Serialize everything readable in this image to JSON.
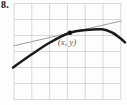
{
  "figure": {
    "problem_number": "8.",
    "point_label": "(x, y)",
    "colors": {
      "background": "#fdfdfd",
      "grid_line": "#c8c8c8",
      "tangent_line": "#a2a2a2",
      "curve": "#1b1b1b",
      "point_dot": "#111111",
      "point_label_text": "#5a5a5a",
      "problem_number_text": "#111111"
    },
    "grid": {
      "x0": 14,
      "y0": 3.5,
      "x1": 120.8,
      "y1": 99.5,
      "cols": 6,
      "rows": 6
    },
    "tangent_line": {
      "x1": 14,
      "y1": 45.7,
      "x2": 121,
      "y2": 21
    },
    "curve_points": [
      [
        13,
        67.5
      ],
      [
        30,
        55.5
      ],
      [
        50,
        42.5
      ],
      [
        70,
        32.8
      ],
      [
        86,
        30
      ],
      [
        102,
        29.3
      ],
      [
        112,
        32.5
      ],
      [
        120,
        38
      ],
      [
        125,
        42.5
      ]
    ],
    "tangency_point": {
      "x": 70,
      "y": 32.8,
      "r": 2.3
    },
    "label_anchor": {
      "x": 67,
      "y": 45
    },
    "stroke_widths": {
      "grid": 0.7,
      "tangent": 1.1,
      "curve": 2.5
    }
  }
}
